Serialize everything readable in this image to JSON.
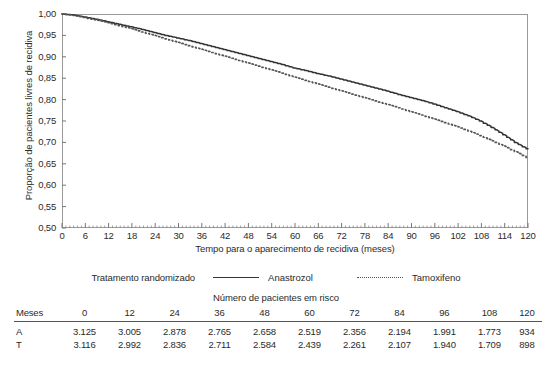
{
  "chart_data": {
    "type": "line",
    "title": "",
    "xlabel": "Tempo para o aparecimento de recidiva (meses)",
    "ylabel": "Proporção de pacientes livres de recidiva",
    "xlim": [
      0,
      120
    ],
    "ylim": [
      0.5,
      1.0
    ],
    "grid": false,
    "legend_position": "bottom",
    "legend_title": "Tratamento randomizado",
    "xticks": [
      "0",
      "6",
      "12",
      "18",
      "24",
      "30",
      "36",
      "42",
      "48",
      "54",
      "60",
      "66",
      "72",
      "78",
      "84",
      "90",
      "96",
      "102",
      "108",
      "114",
      "120"
    ],
    "yticks": [
      "1,00",
      "0,95",
      "0,90",
      "0,85",
      "0,80",
      "0,75",
      "0,70",
      "0,65",
      "0,60",
      "0,55",
      "0,50"
    ],
    "series": [
      {
        "name": "Anastrozol",
        "style": "solid",
        "color": "#333333",
        "x": [
          0,
          3,
          6,
          9,
          12,
          15,
          18,
          21,
          24,
          27,
          30,
          33,
          36,
          39,
          42,
          45,
          48,
          51,
          54,
          57,
          60,
          63,
          66,
          69,
          72,
          75,
          78,
          81,
          84,
          87,
          90,
          93,
          96,
          99,
          102,
          105,
          108,
          111,
          114,
          117,
          120
        ],
        "y": [
          1.0,
          0.998,
          0.993,
          0.988,
          0.982,
          0.976,
          0.97,
          0.964,
          0.957,
          0.95,
          0.944,
          0.938,
          0.931,
          0.924,
          0.917,
          0.91,
          0.903,
          0.896,
          0.889,
          0.882,
          0.874,
          0.868,
          0.861,
          0.855,
          0.848,
          0.841,
          0.834,
          0.827,
          0.82,
          0.812,
          0.805,
          0.798,
          0.79,
          0.781,
          0.772,
          0.762,
          0.75,
          0.735,
          0.718,
          0.7,
          0.685
        ]
      },
      {
        "name": "Tamoxifeno",
        "style": "dotted",
        "color": "#555555",
        "x": [
          0,
          3,
          6,
          9,
          12,
          15,
          18,
          21,
          24,
          27,
          30,
          33,
          36,
          39,
          42,
          45,
          48,
          51,
          54,
          57,
          60,
          63,
          66,
          69,
          72,
          75,
          78,
          81,
          84,
          87,
          90,
          93,
          96,
          99,
          102,
          105,
          108,
          111,
          114,
          117,
          120
        ],
        "y": [
          1.0,
          0.997,
          0.992,
          0.986,
          0.98,
          0.973,
          0.966,
          0.958,
          0.95,
          0.942,
          0.934,
          0.926,
          0.918,
          0.91,
          0.902,
          0.894,
          0.886,
          0.878,
          0.87,
          0.862,
          0.853,
          0.845,
          0.837,
          0.829,
          0.821,
          0.813,
          0.805,
          0.797,
          0.789,
          0.781,
          0.772,
          0.764,
          0.755,
          0.746,
          0.737,
          0.727,
          0.716,
          0.704,
          0.692,
          0.679,
          0.665
        ]
      }
    ]
  },
  "legend": {
    "title": "Tratamento randomizado",
    "items": [
      {
        "label": "Anastrozol",
        "style": "solid"
      },
      {
        "label": "Tamoxifeno",
        "style": "dotted"
      }
    ]
  },
  "risk_table": {
    "title": "Número de pacientes em risco",
    "header_label": "Meses",
    "columns": [
      "0",
      "12",
      "24",
      "36",
      "48",
      "60",
      "72",
      "84",
      "96",
      "108",
      "120"
    ],
    "rows": [
      {
        "label": "A",
        "values": [
          "3.125",
          "3.005",
          "2.878",
          "2.765",
          "2.658",
          "2.519",
          "2.356",
          "2.194",
          "1.991",
          "1.773",
          "934"
        ]
      },
      {
        "label": "T",
        "values": [
          "3.116",
          "2.992",
          "2.836",
          "2.711",
          "2.584",
          "2.439",
          "2.261",
          "2.107",
          "1.940",
          "1.709",
          "898"
        ]
      }
    ]
  }
}
